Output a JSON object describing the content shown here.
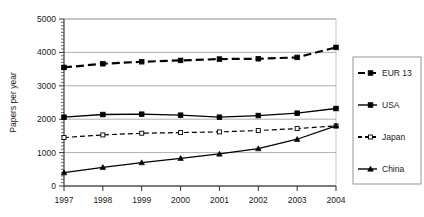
{
  "chart_data": {
    "type": "line",
    "title": "",
    "xlabel": "",
    "ylabel": "Papers per year",
    "categories": [
      "1997",
      "1998",
      "1999",
      "2000",
      "2001",
      "2002",
      "2003",
      "2004"
    ],
    "x": [
      1997,
      1998,
      1999,
      2000,
      2001,
      2002,
      2003,
      2004
    ],
    "xlim": [
      1997,
      2004
    ],
    "ylim": [
      0,
      5000
    ],
    "yticks": [
      0,
      1000,
      2000,
      3000,
      4000,
      5000
    ],
    "ytick_labels": [
      "0",
      "1000",
      "2000",
      "3000",
      "4000",
      "5000"
    ],
    "grid": true,
    "grid_axis": "y",
    "legend_position": "right",
    "minor_ticks_y": true,
    "series": [
      {
        "name": "EUR 13",
        "values": [
          3550,
          3660,
          3720,
          3760,
          3800,
          3810,
          3850,
          4150
        ],
        "style": "dashed",
        "marker": "square",
        "color": "#000000"
      },
      {
        "name": "USA",
        "values": [
          2060,
          2140,
          2150,
          2120,
          2060,
          2110,
          2180,
          2320
        ],
        "style": "solid",
        "marker": "square",
        "color": "#000000"
      },
      {
        "name": "Japan",
        "values": [
          1450,
          1530,
          1580,
          1600,
          1620,
          1660,
          1720,
          1800
        ],
        "style": "dashed",
        "marker": "open-square",
        "color": "#000000"
      },
      {
        "name": "China",
        "values": [
          400,
          560,
          700,
          830,
          960,
          1120,
          1400,
          1800
        ],
        "style": "solid",
        "marker": "triangle",
        "color": "#000000"
      }
    ]
  },
  "legend": {
    "items": [
      {
        "label": "EUR 13"
      },
      {
        "label": "USA"
      },
      {
        "label": "Japan"
      },
      {
        "label": "China"
      }
    ]
  }
}
